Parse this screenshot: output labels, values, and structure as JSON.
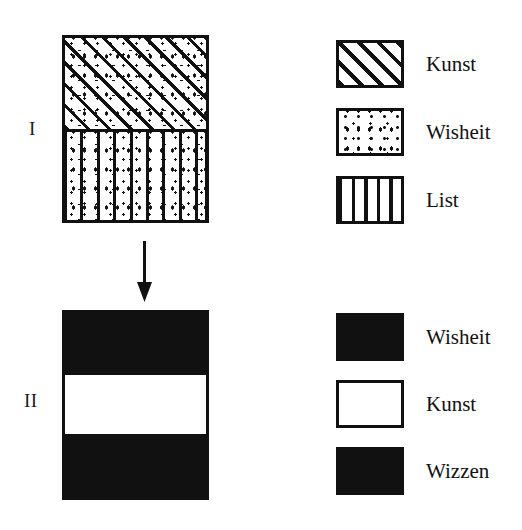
{
  "figure": {
    "title": "",
    "background_color": "#ffffff",
    "ink_color": "#111111"
  },
  "diagrams": [
    {
      "id": "I",
      "label": "I",
      "bands_top_to_bottom": [
        {
          "pattern": "diagonal-hatch-over-stipple",
          "components": [
            "Kunst",
            "Wisheit"
          ],
          "height_fraction": 0.5
        },
        {
          "pattern": "vertical-lines-over-stipple",
          "components": [
            "List",
            "Wisheit"
          ],
          "height_fraction": 0.5
        }
      ]
    },
    {
      "id": "II",
      "label": "II",
      "bands_top_to_bottom": [
        {
          "pattern": "diagonal-cross-hatch",
          "components": [
            "Wisheit"
          ],
          "height_fraction": 0.32
        },
        {
          "pattern": "blank-white",
          "components": [
            "Kunst"
          ],
          "height_fraction": 0.34
        },
        {
          "pattern": "square-grid",
          "components": [
            "Wizzen"
          ],
          "height_fraction": 0.34
        }
      ]
    }
  ],
  "arrow": {
    "name": "down-arrow",
    "direction": "down",
    "from_diagram": "I",
    "to_diagram": "II"
  },
  "legends": [
    {
      "for_diagram": "I",
      "items": [
        {
          "label": "Kunst",
          "pattern": "diagonal-hatch"
        },
        {
          "label": "Wisheit",
          "pattern": "stipple-dots"
        },
        {
          "label": "List",
          "pattern": "vertical-lines"
        }
      ]
    },
    {
      "for_diagram": "II",
      "items": [
        {
          "label": "Wisheit",
          "pattern": "diagonal-cross-hatch"
        },
        {
          "label": "Kunst",
          "pattern": "blank-white"
        },
        {
          "label": "Wizzen",
          "pattern": "square-grid"
        }
      ]
    }
  ],
  "chart_data": {
    "type": "bar",
    "title": "",
    "xlabel": "",
    "ylabel": "",
    "categories": [
      "I",
      "II"
    ],
    "series": [
      {
        "name": "Kunst",
        "values": [
          50,
          34
        ]
      },
      {
        "name": "Wisheit",
        "values": [
          100,
          32
        ]
      },
      {
        "name": "List",
        "values": [
          50,
          0
        ]
      },
      {
        "name": "Wizzen",
        "values": [
          0,
          34
        ]
      }
    ]
  }
}
